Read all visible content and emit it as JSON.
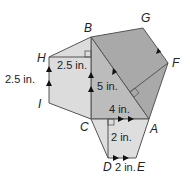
{
  "figure": {
    "vertices": {
      "A": "A",
      "B": "B",
      "C": "C",
      "D": "D",
      "E": "E",
      "F": "F",
      "G": "G",
      "H": "H",
      "I": "I"
    },
    "measurements": {
      "hb_length": "2.5 in.",
      "hi_length": "2.5 in.",
      "bc_length": "5 in.",
      "ca_length": "4 in.",
      "cd_length": "2 in.",
      "de_length": "2 in."
    },
    "colors": {
      "square_fill": "#a8a8a8",
      "triangle_fill": "#b8b8b8",
      "light_fill": "#dcdcdc",
      "stroke": "#555555"
    }
  }
}
